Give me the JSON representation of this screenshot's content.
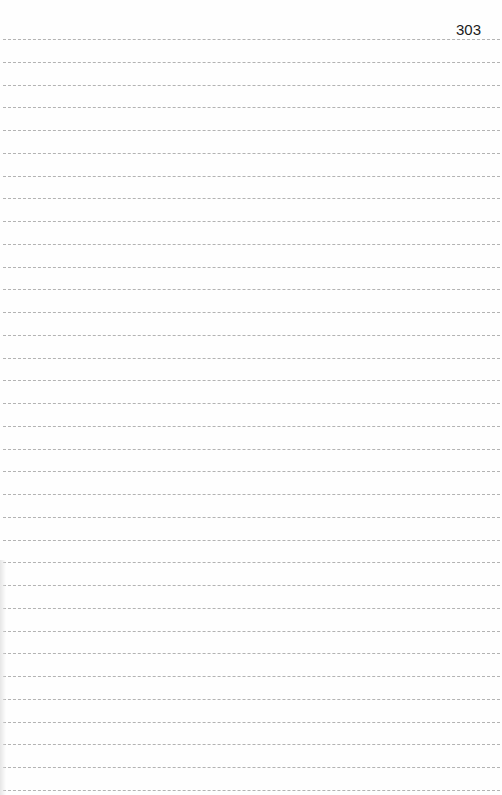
{
  "page": {
    "number": "303",
    "line_count": 34,
    "first_line_y": 39,
    "line_spacing": 22.75,
    "line_color": "#9a9a9a"
  }
}
